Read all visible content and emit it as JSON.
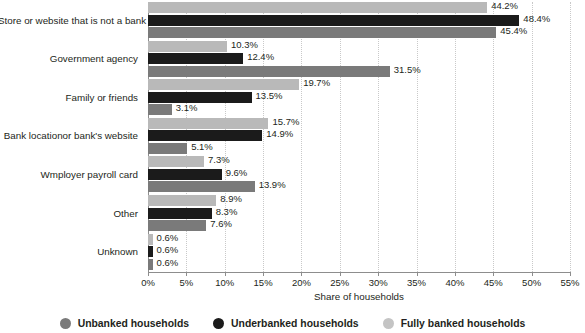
{
  "chart_data": {
    "type": "bar",
    "orientation": "horizontal",
    "title": "",
    "xlabel": "Share of households",
    "ylabel": "",
    "xlim": [
      0,
      55
    ],
    "xticks": [
      "0%",
      "5%",
      "10%",
      "15%",
      "20%",
      "25%",
      "30%",
      "35%",
      "40%",
      "45%",
      "50%",
      "55%"
    ],
    "xtick_values": [
      0,
      5,
      10,
      15,
      20,
      25,
      30,
      35,
      40,
      45,
      50,
      55
    ],
    "grid": true,
    "legend_position": "bottom",
    "categories": [
      "Store or website that is not a bank",
      "Government agency",
      "Family or friends",
      "Bank locationor bank's website",
      "Wmployer payroll card",
      "Other",
      "Unknown"
    ],
    "series": [
      {
        "name": "Fully banked households",
        "key": "fully",
        "color": "#b9b9b9",
        "values": [
          44.2,
          10.3,
          19.7,
          15.7,
          7.3,
          8.9,
          0.6
        ],
        "labels": [
          "44.2%",
          "10.3%",
          "19.7%",
          "15.7%",
          "7.3%",
          "8.9%",
          "0.6%"
        ]
      },
      {
        "name": "Underbanked households",
        "key": "under",
        "color": "#1b1b1b",
        "values": [
          48.4,
          12.4,
          13.5,
          14.9,
          9.6,
          8.3,
          0.6
        ],
        "labels": [
          "48.4%",
          "12.4%",
          "13.5%",
          "14.9%",
          "9.6%",
          "8.3%",
          "0.6%"
        ]
      },
      {
        "name": "Unbanked households",
        "key": "unbanked",
        "color": "#7a7a7a",
        "values": [
          45.4,
          31.5,
          3.1,
          5.1,
          13.9,
          7.6,
          0.6
        ],
        "labels": [
          "45.4%",
          "31.5%",
          "3.1%",
          "5.1%",
          "13.9%",
          "7.6%",
          "0.6%"
        ]
      }
    ]
  },
  "legend": {
    "items": [
      {
        "label": "Unbanked households",
        "key": "unbanked"
      },
      {
        "label": "Underbanked households",
        "key": "under"
      },
      {
        "label": "Fully banked households",
        "key": "fully"
      }
    ]
  },
  "axis": {
    "x_title": "Share of households"
  }
}
